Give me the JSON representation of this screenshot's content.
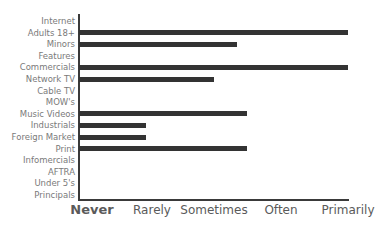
{
  "chart_data": {
    "type": "bar",
    "orientation": "horizontal",
    "title": "",
    "xlabel": "",
    "ylabel": "",
    "categories": [
      "Internet",
      "Adults 18+",
      "Minors",
      "Features",
      "Commercials",
      "Network TV",
      "Cable TV",
      "MOW's",
      "Music Videos",
      "Industrials",
      "Foreign Market",
      "Print",
      "Infomercials",
      "AFTRA",
      "Under 5's",
      "Principals"
    ],
    "values": [
      0,
      4,
      2.35,
      0,
      4,
      2,
      0,
      0,
      2.5,
      1,
      1,
      2.5,
      0,
      0,
      0,
      0
    ],
    "x_tick_labels": [
      "Never",
      "Rarely",
      "Sometimes",
      "Often",
      "Primarily"
    ],
    "x_tick_values": [
      0,
      1,
      2,
      3,
      4
    ],
    "xlim": [
      0,
      4
    ],
    "grid": false,
    "legend": null,
    "bar_color": "#333333"
  }
}
